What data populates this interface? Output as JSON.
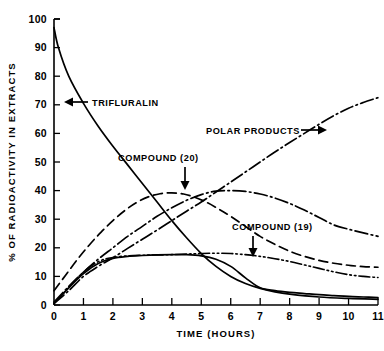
{
  "chart_data": {
    "type": "line",
    "title": "",
    "xlabel": "TIME (HOURS)",
    "ylabel": "% OF RADIOACTIVITY IN EXTRACTS",
    "xlim": [
      0,
      11
    ],
    "ylim": [
      0,
      100
    ],
    "grid": false,
    "legend_position": "inline-annotations",
    "xticks": [
      0,
      1,
      2,
      3,
      4,
      5,
      6,
      7,
      8,
      9,
      10,
      11
    ],
    "xticklabels": [
      "0",
      "1",
      "2",
      "3",
      "4",
      "5",
      "6",
      "7",
      "8",
      "9",
      "10",
      "11"
    ],
    "yticks": [
      0,
      10,
      20,
      30,
      40,
      50,
      60,
      70,
      80,
      90,
      100
    ],
    "yticklabels": [
      "0",
      "10",
      "20",
      "30",
      "40",
      "50",
      "60",
      "70",
      "80",
      "90",
      "100"
    ],
    "series": [
      {
        "name": "TRIFLURALIN",
        "style": "solid",
        "x": [
          0.0,
          0.15,
          0.5,
          1.0,
          1.5,
          2.0,
          2.5,
          3.0,
          3.5,
          4.0,
          4.5,
          5.0,
          5.5,
          6.0,
          6.5,
          7.0,
          7.5,
          8.0,
          9.0,
          10.0,
          11.0
        ],
        "y": [
          97.0,
          90.0,
          80.0,
          70.5,
          62.5,
          55.5,
          49.0,
          42.5,
          36.0,
          29.5,
          23.5,
          18.0,
          13.5,
          10.0,
          7.5,
          5.8,
          4.6,
          3.8,
          2.8,
          2.3,
          2.0
        ]
      },
      {
        "name": "COMPOUND (19)",
        "style": "dashed",
        "x": [
          0.0,
          0.4,
          0.8,
          1.2,
          1.6,
          2.0,
          2.4,
          2.8,
          3.2,
          3.6,
          4.0,
          4.4,
          4.8,
          5.2,
          5.6,
          6.0,
          6.5,
          7.0,
          7.5,
          8.0,
          8.5,
          9.0,
          9.5,
          10.0,
          10.5,
          11.0
        ],
        "y": [
          5.0,
          10.5,
          16.0,
          21.0,
          25.5,
          29.5,
          33.0,
          35.8,
          37.8,
          38.9,
          39.2,
          38.8,
          37.6,
          35.8,
          33.5,
          31.0,
          27.5,
          24.0,
          21.2,
          18.8,
          17.0,
          15.6,
          14.6,
          13.9,
          13.4,
          13.2
        ]
      },
      {
        "name": "COMPOUND (20)",
        "style": "dash-dot",
        "x": [
          0.0,
          0.5,
          1.0,
          1.5,
          2.0,
          2.5,
          3.0,
          3.5,
          4.0,
          4.5,
          5.0,
          5.5,
          6.0,
          6.5,
          7.0,
          7.5,
          8.0,
          8.5,
          9.0,
          9.5,
          10.0,
          10.5,
          11.0
        ],
        "y": [
          1.0,
          6.5,
          11.5,
          16.0,
          20.0,
          24.0,
          27.5,
          31.0,
          34.0,
          36.6,
          38.6,
          39.8,
          40.0,
          39.7,
          38.8,
          37.4,
          35.5,
          33.2,
          30.6,
          28.0,
          26.5,
          25.2,
          24.0
        ]
      },
      {
        "name": "POLAR PRODUCTS",
        "style": "dash-dot",
        "x": [
          0.0,
          0.5,
          1.0,
          1.5,
          2.0,
          2.5,
          3.0,
          3.5,
          4.0,
          4.5,
          5.0,
          5.5,
          6.0,
          6.5,
          7.0,
          7.5,
          8.0,
          8.5,
          9.0,
          9.5,
          10.0,
          10.5,
          11.0
        ],
        "y": [
          0.5,
          5.0,
          10.0,
          13.5,
          16.5,
          19.8,
          23.0,
          26.2,
          29.5,
          32.8,
          36.0,
          39.5,
          43.0,
          46.5,
          50.0,
          53.5,
          56.8,
          60.0,
          63.2,
          66.2,
          68.8,
          70.8,
          72.5
        ]
      },
      {
        "name": "UNLABELED",
        "style": "dash-dot-dot",
        "x": [
          0.0,
          0.4,
          0.8,
          1.2,
          1.6,
          2.0,
          2.5,
          3.0,
          3.5,
          4.0,
          4.5,
          5.0,
          5.5,
          6.0,
          6.5,
          7.0,
          7.5,
          8.0,
          8.5,
          9.0,
          9.5,
          10.0,
          10.5,
          11.0
        ],
        "y": [
          0.5,
          5.0,
          9.5,
          13.2,
          15.6,
          16.6,
          17.2,
          17.4,
          17.5,
          17.6,
          17.8,
          18.0,
          18.1,
          18.0,
          17.6,
          17.0,
          16.2,
          15.2,
          14.0,
          12.8,
          11.6,
          10.6,
          10.0,
          9.6
        ]
      },
      {
        "name": "BASELINE",
        "style": "solid",
        "x": [
          0.0,
          0.5,
          1.0,
          1.5,
          2.0,
          2.5,
          3.0,
          3.5,
          4.0,
          4.5,
          5.0,
          5.5,
          6.0,
          6.5,
          7.0,
          7.5,
          8.0,
          8.5,
          9.0,
          9.5,
          10.0,
          10.5,
          11.0
        ],
        "y": [
          0.5,
          6.0,
          11.0,
          14.5,
          16.3,
          17.0,
          17.3,
          17.5,
          17.6,
          17.6,
          17.2,
          16.0,
          13.5,
          9.5,
          6.0,
          5.0,
          4.4,
          4.0,
          3.6,
          3.3,
          3.0,
          2.8,
          2.6
        ]
      }
    ],
    "annotations": [
      {
        "label": "TRIFLURALIN",
        "arrow": "left"
      },
      {
        "label": "COMPOUND (20)",
        "arrow": "down"
      },
      {
        "label": "COMPOUND (19)",
        "arrow": "down"
      },
      {
        "label": "POLAR PRODUCTS",
        "arrow": "right"
      }
    ]
  }
}
